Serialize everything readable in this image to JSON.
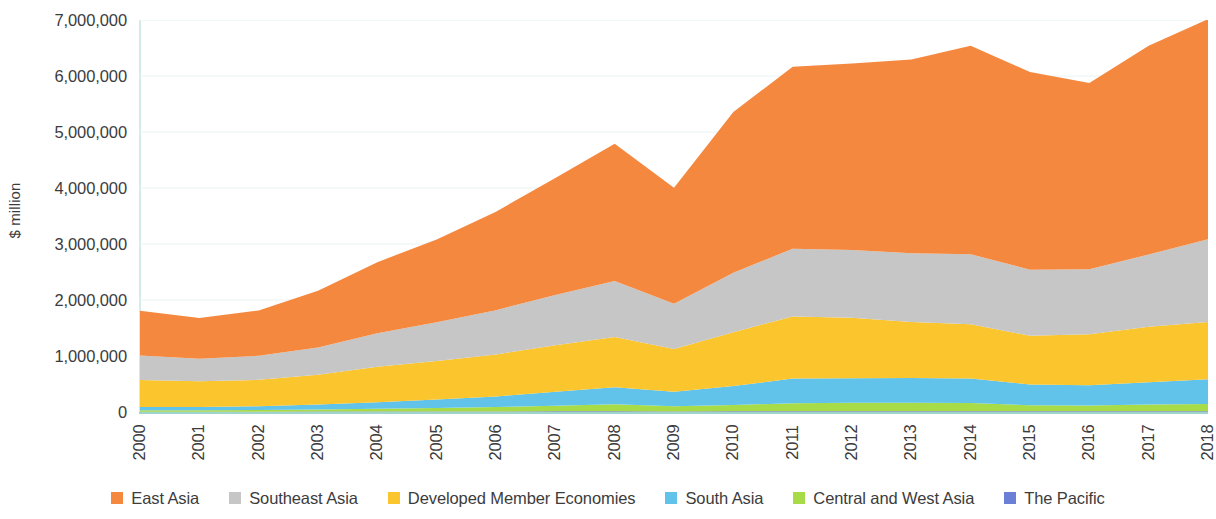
{
  "chart_data": {
    "type": "area",
    "stacked": true,
    "title": "",
    "xlabel": "",
    "ylabel": "$ million",
    "ylim": [
      0,
      7000000
    ],
    "ytick_values": [
      0,
      1000000,
      2000000,
      3000000,
      4000000,
      5000000,
      6000000,
      7000000
    ],
    "ytick_labels": [
      "0",
      "1,000,000",
      "2,000,000",
      "3,000,000",
      "4,000,000",
      "5,000,000",
      "6,000,000",
      "7,000,000"
    ],
    "grid": true,
    "legend_position": "bottom",
    "categories": [
      "2000",
      "2001",
      "2002",
      "2003",
      "2004",
      "2005",
      "2006",
      "2007",
      "2008",
      "2009",
      "2010",
      "2011",
      "2012",
      "2013",
      "2014",
      "2015",
      "2016",
      "2017",
      "2018"
    ],
    "stack_order_bottom_to_top": [
      "The Pacific",
      "Central and West Asia",
      "South Asia",
      "Developed Member Economies",
      "Southeast Asia",
      "East Asia"
    ],
    "series": [
      {
        "name": "East Asia",
        "color": "#F5883F",
        "values": [
          800000,
          730000,
          810000,
          1010000,
          1270000,
          1480000,
          1760000,
          2090000,
          2450000,
          2070000,
          2870000,
          3250000,
          3330000,
          3460000,
          3720000,
          3530000,
          3330000,
          3730000,
          3930000
        ]
      },
      {
        "name": "Southeast Asia",
        "color": "#C6C6C6",
        "values": [
          440000,
          400000,
          430000,
          490000,
          600000,
          690000,
          790000,
          900000,
          1000000,
          810000,
          1060000,
          1210000,
          1210000,
          1230000,
          1250000,
          1180000,
          1160000,
          1290000,
          1480000
        ]
      },
      {
        "name": "Developed Member Economies",
        "color": "#FBC52D",
        "values": [
          480000,
          460000,
          470000,
          530000,
          630000,
          690000,
          750000,
          830000,
          900000,
          760000,
          960000,
          1110000,
          1080000,
          1000000,
          970000,
          870000,
          910000,
          990000,
          1020000
        ]
      },
      {
        "name": "South Asia",
        "color": "#62C3EA",
        "values": [
          60000,
          60000,
          70000,
          90000,
          120000,
          150000,
          190000,
          250000,
          300000,
          260000,
          340000,
          440000,
          440000,
          440000,
          440000,
          370000,
          360000,
          400000,
          440000
        ]
      },
      {
        "name": "Central and West Asia",
        "color": "#A8DB48",
        "values": [
          24000,
          24000,
          28000,
          36000,
          48000,
          62000,
          78000,
          98000,
          126000,
          92000,
          112000,
          142000,
          148000,
          150000,
          144000,
          108000,
          104000,
          118000,
          130000
        ]
      },
      {
        "name": "The Pacific",
        "color": "#6B7FD7",
        "values": [
          6000,
          6000,
          6000,
          7000,
          8000,
          9000,
          10000,
          12000,
          14000,
          11000,
          13000,
          15000,
          15000,
          15000,
          15000,
          13000,
          13000,
          14000,
          15000
        ]
      }
    ]
  },
  "axis": {
    "y_title": "$ million"
  },
  "colors": {
    "east_asia": "#F5883F",
    "southeast_asia": "#C6C6C6",
    "developed_member_economies": "#FBC52D",
    "south_asia": "#62C3EA",
    "central_and_west_asia": "#A8DB48",
    "the_pacific": "#6B7FD7",
    "axis_line": "#9fd4cd",
    "grid_line": "#e8f4f2",
    "text": "#3c3c3c"
  }
}
